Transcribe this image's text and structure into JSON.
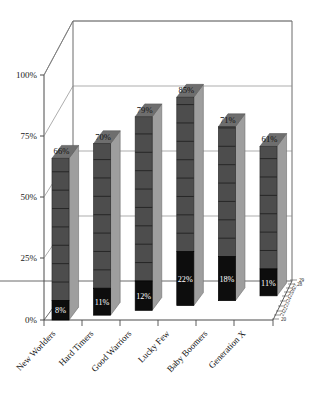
{
  "chart_data": {
    "type": "bar",
    "title": "",
    "subtitle": "",
    "xlabel": "",
    "ylabel": "",
    "ylim": [
      0,
      100
    ],
    "yticks": [
      "0%",
      "25%",
      "50%",
      "75%",
      "100%"
    ],
    "ytick_values": [
      0,
      25,
      50,
      75,
      100
    ],
    "grid": true,
    "legend": "none",
    "projection": "3d",
    "depth_axis_ticks": [
      "20",
      "21",
      "22",
      "23",
      "24",
      "25",
      "26",
      "27",
      "28",
      "29"
    ],
    "categories": [
      "New Worlders",
      "Hard Timers",
      "Good Warriors",
      "Lucky Few",
      "Baby Boomers",
      "Generation X"
    ],
    "series": [
      {
        "name": "base",
        "color": "#0d0d0d",
        "values": [
          8,
          11,
          12,
          22,
          18,
          11
        ],
        "labels": [
          "8%",
          "11%",
          "12%",
          "22%",
          "18%",
          "11%"
        ]
      },
      {
        "name": "total",
        "color": "#4d4d4d",
        "values": [
          66,
          70,
          79,
          85,
          71,
          61
        ],
        "labels": [
          "66%",
          "70%",
          "79%",
          "85%",
          "71%",
          "61%"
        ]
      }
    ],
    "colors": {
      "bar_front": "#4d4d4d",
      "bar_side": "#9e9e9e",
      "bar_top": "#6e6e6e",
      "bar_base": "#0d0d0d",
      "floor": "#ffffff",
      "wall": "#ffffff",
      "axis": "#4a4a4a",
      "gridline": "#8a8a8a",
      "text": "#111111"
    }
  }
}
